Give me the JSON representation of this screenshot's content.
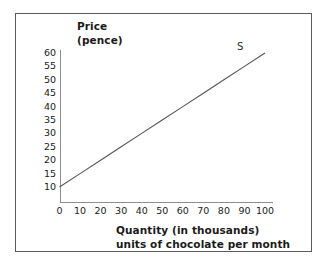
{
  "chart_data": {
    "type": "line",
    "title": "",
    "xlabel": "Quantity (in thousands) units of chocolate per month",
    "xlabel_line1": "Quantity (in thousands)",
    "xlabel_line2": "units of chocolate per month",
    "ylabel": "Price (pence)",
    "ylabel_line1": "Price",
    "ylabel_line2": "(pence)",
    "xlim": [
      0,
      100
    ],
    "ylim": [
      0,
      60
    ],
    "xticks": [
      0,
      10,
      20,
      30,
      40,
      50,
      60,
      70,
      80,
      90,
      100
    ],
    "yticks": [
      10,
      15,
      20,
      25,
      30,
      35,
      40,
      45,
      50,
      55,
      60
    ],
    "xtick_labels": [
      "0",
      "10",
      "20",
      "30",
      "40",
      "50",
      "60",
      "70",
      "80",
      "90",
      "100"
    ],
    "ytick_labels": [
      "60",
      "55",
      "50",
      "45",
      "40",
      "35",
      "30",
      "25",
      "20",
      "15",
      "10"
    ],
    "grid": false,
    "legend": "none",
    "series": [
      {
        "name": "S",
        "label": "S",
        "points": [
          {
            "x": 0,
            "y": 10
          },
          {
            "x": 10,
            "y": 15
          },
          {
            "x": 20,
            "y": 20
          },
          {
            "x": 30,
            "y": 25
          },
          {
            "x": 40,
            "y": 30
          },
          {
            "x": 50,
            "y": 35
          },
          {
            "x": 60,
            "y": 40
          },
          {
            "x": 70,
            "y": 45
          },
          {
            "x": 80,
            "y": 50
          },
          {
            "x": 90,
            "y": 55
          },
          {
            "x": 100,
            "y": 60
          }
        ],
        "color": "#555555"
      }
    ],
    "annotations": [
      {
        "text": "S",
        "x": 100,
        "y": 62
      }
    ]
  },
  "figure": {
    "border_color": "#5b5b5b",
    "background": "#ffffff",
    "axis_color": "#8e8e8e",
    "text_color": "#1a1a1a"
  }
}
